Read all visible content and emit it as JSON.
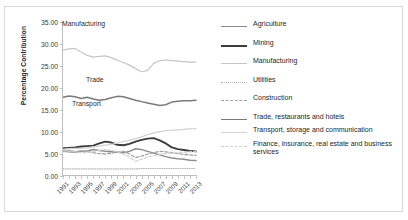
{
  "chart_data": {
    "type": "line",
    "title": "",
    "xlabel": "",
    "ylabel": "Percentage Contribution",
    "ylim": [
      0,
      35
    ],
    "ytick_step": 5,
    "ytick_labels": [
      "0.00",
      "5.00",
      "10.00",
      "15.00",
      "20.00",
      "25.00",
      "30.00",
      "35.00"
    ],
    "grid": false,
    "legend_position": "right",
    "x": [
      1991,
      1992,
      1993,
      1994,
      1995,
      1996,
      1997,
      1998,
      1999,
      2000,
      2001,
      2002,
      2003,
      2004,
      2005,
      2006,
      2007,
      2008,
      2009,
      2010,
      2011,
      2012,
      2013
    ],
    "xtick_labels": [
      "1991",
      "1993",
      "1995",
      "1997",
      "1999",
      "2001",
      "2003",
      "2005",
      "2007",
      "2009",
      "2011",
      "2013"
    ],
    "annotations": [
      {
        "text": "Manufacturing",
        "x": 1997,
        "y": 27.5
      },
      {
        "text": "Trade",
        "x": 2001,
        "y": 17.5
      },
      {
        "text": "Transport",
        "x": 1999,
        "y": 13.0
      }
    ],
    "series": [
      {
        "name": "Agriculture",
        "values": [
          5.6,
          5.5,
          5.4,
          5.6,
          5.7,
          6.0,
          5.8,
          5.6,
          5.5,
          5.4,
          5.3,
          5.6,
          6.2,
          6.0,
          5.6,
          5.2,
          4.8,
          4.4,
          4.1,
          3.9,
          3.8,
          3.6,
          3.5
        ]
      },
      {
        "name": "Mining",
        "values": [
          6.3,
          6.4,
          6.5,
          6.7,
          6.8,
          6.9,
          7.4,
          7.8,
          7.6,
          7.1,
          7.0,
          7.3,
          7.8,
          8.2,
          8.5,
          8.6,
          8.1,
          7.4,
          6.5,
          6.1,
          5.9,
          5.7,
          5.6
        ]
      },
      {
        "name": "Manufacturing",
        "values": [
          28.6,
          28.9,
          29.0,
          28.2,
          27.4,
          27.0,
          27.2,
          27.3,
          26.9,
          26.3,
          25.8,
          25.2,
          24.4,
          23.7,
          24.0,
          25.6,
          26.2,
          26.4,
          26.2,
          26.1,
          26.0,
          25.9,
          25.9
        ]
      },
      {
        "name": "Utilities",
        "values": [
          1.6,
          1.6,
          1.6,
          1.6,
          1.6,
          1.6,
          1.6,
          1.6,
          1.6,
          1.6,
          1.6,
          1.6,
          1.6,
          1.7,
          1.7,
          1.7,
          1.7,
          1.7,
          1.7,
          1.7,
          1.7,
          1.7,
          1.7
        ]
      },
      {
        "name": "Construction",
        "values": [
          6.0,
          5.8,
          5.6,
          5.7,
          5.6,
          5.3,
          5.1,
          5.0,
          5.2,
          5.4,
          5.6,
          5.0,
          4.2,
          4.5,
          5.0,
          5.3,
          5.6,
          5.5,
          5.3,
          5.1,
          4.9,
          4.8,
          4.7
        ]
      },
      {
        "name": "Trade, restaurants and hotels",
        "values": [
          17.9,
          18.2,
          18.0,
          17.6,
          17.9,
          17.5,
          17.2,
          17.4,
          17.8,
          18.1,
          18.0,
          17.6,
          17.2,
          16.9,
          16.6,
          16.3,
          16.0,
          16.2,
          16.8,
          17.0,
          17.1,
          17.1,
          17.2
        ]
      },
      {
        "name": "Transport, storage and communication",
        "values": [
          6.1,
          6.2,
          6.3,
          6.3,
          6.4,
          6.6,
          6.8,
          7.0,
          7.2,
          7.5,
          7.8,
          8.1,
          8.5,
          8.9,
          9.4,
          9.8,
          10.1,
          10.3,
          10.4,
          10.5,
          10.6,
          10.7,
          10.8
        ]
      },
      {
        "name": "Finance, insurance, real estate and business services",
        "values": [
          5.7,
          5.6,
          5.5,
          5.3,
          5.4,
          5.6,
          5.8,
          6.0,
          5.8,
          5.5,
          5.0,
          4.3,
          3.3,
          3.8,
          4.3,
          4.6,
          4.9,
          5.1,
          5.2,
          5.3,
          5.4,
          5.5,
          5.6
        ]
      }
    ]
  },
  "axis": {
    "ylabel": "Percentage Contribution",
    "yticks": [
      "35.00",
      "30.00",
      "25.00",
      "20.00",
      "15.00",
      "10.00",
      "5.00",
      "0.00"
    ],
    "xticks": [
      "1991",
      "1993",
      "1995",
      "1997",
      "1999",
      "2001",
      "2003",
      "2005",
      "2007",
      "2009",
      "2011",
      "2013"
    ]
  },
  "annotations": {
    "manufacturing": "Manufacturing",
    "trade": "Trade",
    "transport": "Transport"
  },
  "legend": {
    "items": [
      {
        "label": "Agriculture",
        "key": "agriculture-line-key",
        "color": "#8c8c8c"
      },
      {
        "label": "Mining",
        "key": "mining-line-key",
        "color": "#3d3d3d"
      },
      {
        "label": "Manufacturing",
        "key": "manufacturing-line-key",
        "color": "#c6c6c6"
      },
      {
        "label": "Utilities",
        "key": "utilities-line-key",
        "color": "#b5b5b5"
      },
      {
        "label": "Construction",
        "key": "construction-line-key",
        "color": "#a3a3a3"
      },
      {
        "label": "Trade, restaurants and hotels",
        "key": "trade-line-key",
        "color": "#7a7a7a"
      },
      {
        "label": "Transport, storage and communication",
        "key": "transport-line-key",
        "color": "#d2d2d2"
      },
      {
        "label": "Finance, insurance, real estate and business services",
        "key": "finance-line-key",
        "color": "#cfcfcf"
      }
    ]
  }
}
